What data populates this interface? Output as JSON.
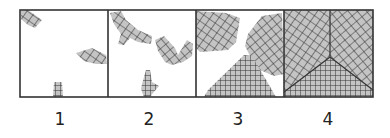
{
  "figure": {
    "panels": [
      {
        "label": "1",
        "stage": "isolated small nuclei"
      },
      {
        "label": "2",
        "stage": "branched growing grains"
      },
      {
        "label": "3",
        "stage": "large grains near impingement"
      },
      {
        "label": "4",
        "stage": "complete coverage with grain boundaries"
      }
    ],
    "colors": {
      "fill": "#c4c4c4",
      "hatch": "#333333",
      "border": "#333333",
      "background": "#ffffff"
    }
  }
}
